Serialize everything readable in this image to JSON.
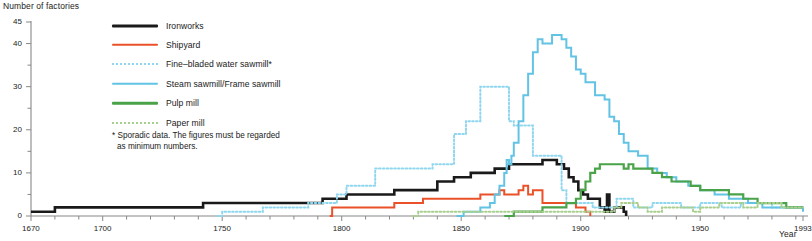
{
  "axes": {
    "y_title": "Number of factories",
    "x_title": "Year",
    "y_tick_labels": [
      "45",
      "40",
      "30",
      "20",
      "10",
      "0"
    ],
    "x_tick_labels": [
      "1670",
      "1700",
      "1750",
      "1800",
      "1850",
      "1900",
      "1950",
      "1993"
    ]
  },
  "legend": {
    "items": [
      {
        "label": "Ironworks",
        "color": "#1a1a1a",
        "style": "thick"
      },
      {
        "label": "Shipyard",
        "color": "#ea5128",
        "style": "solid"
      },
      {
        "label": "Fine–bladed water sawmill*",
        "color": "#8fd6ef",
        "style": "dotted"
      },
      {
        "label": "Steam sawmill/Frame sawmill",
        "color": "#62c3e4",
        "style": "solid"
      },
      {
        "label": "Pulp mill",
        "color": "#4aa348",
        "style": "solid"
      },
      {
        "label": "Paper mill",
        "color": "#a8cf8e",
        "style": "dotted"
      }
    ]
  },
  "footnote": {
    "line1": "* Sporadic data. The figures must be regarded",
    "line2": "as minimum numbers."
  },
  "ghost_title": "",
  "chart_data": {
    "type": "line",
    "title": "",
    "xlabel": "Year",
    "ylabel": "Number of factories",
    "xlim": [
      1670,
      1993
    ],
    "ylim": [
      0,
      45
    ],
    "yticks": [
      0,
      5,
      10,
      15,
      20,
      25,
      30,
      35,
      40,
      45
    ],
    "ylabelled_ticks": [
      0,
      10,
      20,
      30,
      40,
      45
    ],
    "xticks": [
      1670,
      1680,
      1690,
      1700,
      1710,
      1720,
      1730,
      1740,
      1750,
      1760,
      1770,
      1780,
      1790,
      1800,
      1810,
      1820,
      1830,
      1840,
      1850,
      1860,
      1870,
      1880,
      1890,
      1900,
      1910,
      1920,
      1930,
      1940,
      1950,
      1960,
      1970,
      1980,
      1990
    ],
    "xlabelled_ticks": [
      1670,
      1700,
      1750,
      1800,
      1850,
      1900,
      1950,
      1993
    ],
    "grid": false,
    "legend_position": "top-left-inside",
    "step_style": "post",
    "series": [
      {
        "name": "Ironworks",
        "color": "#1a1a1a",
        "style": "solid",
        "width": 2.6,
        "points": [
          [
            1670,
            1
          ],
          [
            1678,
            1
          ],
          [
            1680,
            2
          ],
          [
            1740,
            2
          ],
          [
            1742,
            3
          ],
          [
            1790,
            3
          ],
          [
            1792,
            4
          ],
          [
            1800,
            4
          ],
          [
            1802,
            5
          ],
          [
            1820,
            5
          ],
          [
            1822,
            6
          ],
          [
            1838,
            6
          ],
          [
            1840,
            8
          ],
          [
            1845,
            8
          ],
          [
            1847,
            9
          ],
          [
            1852,
            9
          ],
          [
            1854,
            10
          ],
          [
            1862,
            10
          ],
          [
            1864,
            11
          ],
          [
            1868,
            11
          ],
          [
            1870,
            12
          ],
          [
            1882,
            12
          ],
          [
            1884,
            13
          ],
          [
            1888,
            13
          ],
          [
            1890,
            12
          ],
          [
            1893,
            11
          ],
          [
            1895,
            9
          ],
          [
            1897,
            8
          ],
          [
            1899,
            6
          ],
          [
            1901,
            5
          ],
          [
            1903,
            4
          ],
          [
            1906,
            4
          ],
          [
            1908,
            2
          ],
          [
            1910,
            1
          ],
          [
            1911,
            5
          ],
          [
            1912,
            1
          ],
          [
            1914,
            2
          ],
          [
            1916,
            2
          ],
          [
            1918,
            1
          ],
          [
            1919,
            0
          ]
        ]
      },
      {
        "name": "Shipyard",
        "color": "#ea5128",
        "style": "solid",
        "width": 2.0,
        "points": [
          [
            1795,
            0
          ],
          [
            1796,
            2
          ],
          [
            1820,
            2
          ],
          [
            1822,
            3
          ],
          [
            1832,
            3
          ],
          [
            1834,
            4
          ],
          [
            1856,
            4
          ],
          [
            1858,
            5
          ],
          [
            1864,
            5
          ],
          [
            1866,
            6
          ],
          [
            1868,
            5
          ],
          [
            1872,
            5
          ],
          [
            1874,
            6
          ],
          [
            1876,
            7
          ],
          [
            1878,
            5
          ],
          [
            1880,
            6
          ],
          [
            1882,
            6
          ],
          [
            1884,
            3
          ],
          [
            1896,
            3
          ],
          [
            1898,
            2
          ],
          [
            1900,
            2
          ],
          [
            1902,
            1
          ],
          [
            1904,
            0
          ]
        ]
      },
      {
        "name": "Fine–bladed water sawmill*",
        "color": "#8fd6ef",
        "style": "dotted",
        "width": 2.0,
        "points": [
          [
            1748,
            0
          ],
          [
            1750,
            1
          ],
          [
            1765,
            1
          ],
          [
            1767,
            2
          ],
          [
            1784,
            2
          ],
          [
            1786,
            3
          ],
          [
            1796,
            3
          ],
          [
            1798,
            5
          ],
          [
            1800,
            5
          ],
          [
            1802,
            7
          ],
          [
            1812,
            7
          ],
          [
            1814,
            11
          ],
          [
            1836,
            11
          ],
          [
            1838,
            12
          ],
          [
            1845,
            12
          ],
          [
            1847,
            19
          ],
          [
            1850,
            19
          ],
          [
            1852,
            22
          ],
          [
            1856,
            22
          ],
          [
            1858,
            30
          ],
          [
            1868,
            30
          ],
          [
            1870,
            22
          ],
          [
            1872,
            21
          ],
          [
            1878,
            21
          ],
          [
            1880,
            14
          ],
          [
            1890,
            14
          ],
          [
            1892,
            6
          ],
          [
            1894,
            3
          ],
          [
            1903,
            3
          ],
          [
            1905,
            2
          ],
          [
            1913,
            2
          ],
          [
            1915,
            4
          ],
          [
            1920,
            4
          ],
          [
            1922,
            2
          ],
          [
            1928,
            2
          ],
          [
            1930,
            3
          ],
          [
            1940,
            3
          ],
          [
            1942,
            2
          ],
          [
            1948,
            2
          ],
          [
            1950,
            3
          ],
          [
            1957,
            3
          ],
          [
            1959,
            2
          ],
          [
            1965,
            2
          ],
          [
            1967,
            3
          ],
          [
            1978,
            3
          ],
          [
            1980,
            2
          ],
          [
            1993,
            2
          ]
        ]
      },
      {
        "name": "Steam sawmill/Frame sawmill",
        "color": "#62c3e4",
        "style": "solid",
        "width": 2.0,
        "points": [
          [
            1848,
            0
          ],
          [
            1851,
            1
          ],
          [
            1856,
            1
          ],
          [
            1858,
            2
          ],
          [
            1862,
            3
          ],
          [
            1864,
            5
          ],
          [
            1866,
            7
          ],
          [
            1868,
            10
          ],
          [
            1869,
            13
          ],
          [
            1870,
            12
          ],
          [
            1871,
            14
          ],
          [
            1872,
            17
          ],
          [
            1874,
            22
          ],
          [
            1876,
            28
          ],
          [
            1878,
            33
          ],
          [
            1880,
            38
          ],
          [
            1882,
            41
          ],
          [
            1884,
            40
          ],
          [
            1886,
            40
          ],
          [
            1888,
            42
          ],
          [
            1890,
            42
          ],
          [
            1892,
            41
          ],
          [
            1894,
            39
          ],
          [
            1896,
            37
          ],
          [
            1898,
            34
          ],
          [
            1900,
            33
          ],
          [
            1902,
            31
          ],
          [
            1904,
            31
          ],
          [
            1906,
            28
          ],
          [
            1908,
            28
          ],
          [
            1910,
            27
          ],
          [
            1912,
            23
          ],
          [
            1914,
            22
          ],
          [
            1916,
            19
          ],
          [
            1918,
            17
          ],
          [
            1920,
            15
          ],
          [
            1924,
            14
          ],
          [
            1928,
            11
          ],
          [
            1932,
            10
          ],
          [
            1936,
            9
          ],
          [
            1940,
            8
          ],
          [
            1945,
            7
          ],
          [
            1950,
            6
          ],
          [
            1956,
            5
          ],
          [
            1962,
            4
          ],
          [
            1970,
            3
          ],
          [
            1976,
            2
          ],
          [
            1984,
            2
          ],
          [
            1993,
            1
          ]
        ]
      },
      {
        "name": "Pulp mill",
        "color": "#4aa348",
        "style": "solid",
        "width": 2.2,
        "points": [
          [
            1868,
            0
          ],
          [
            1872,
            1
          ],
          [
            1880,
            1
          ],
          [
            1884,
            2
          ],
          [
            1890,
            2
          ],
          [
            1894,
            3
          ],
          [
            1898,
            4
          ],
          [
            1900,
            6
          ],
          [
            1902,
            8
          ],
          [
            1904,
            10
          ],
          [
            1906,
            11
          ],
          [
            1908,
            12
          ],
          [
            1912,
            12
          ],
          [
            1916,
            12
          ],
          [
            1918,
            11
          ],
          [
            1920,
            12
          ],
          [
            1922,
            11
          ],
          [
            1926,
            11
          ],
          [
            1930,
            10
          ],
          [
            1934,
            9
          ],
          [
            1938,
            8
          ],
          [
            1942,
            8
          ],
          [
            1946,
            7
          ],
          [
            1950,
            6
          ],
          [
            1956,
            6
          ],
          [
            1962,
            5
          ],
          [
            1968,
            4
          ],
          [
            1974,
            3
          ],
          [
            1980,
            3
          ],
          [
            1986,
            2
          ],
          [
            1993,
            2
          ]
        ]
      },
      {
        "name": "Paper mill",
        "color": "#a8cf8e",
        "style": "dotted",
        "width": 2.0,
        "points": [
          [
            1830,
            0
          ],
          [
            1832,
            1
          ],
          [
            1880,
            1
          ],
          [
            1895,
            1
          ],
          [
            1900,
            1
          ],
          [
            1910,
            1
          ],
          [
            1914,
            2
          ],
          [
            1917,
            3
          ],
          [
            1920,
            3
          ],
          [
            1924,
            2
          ],
          [
            1928,
            1
          ],
          [
            1934,
            2
          ],
          [
            1944,
            2
          ],
          [
            1947,
            1
          ],
          [
            1950,
            2
          ],
          [
            1954,
            2
          ],
          [
            1958,
            3
          ],
          [
            1965,
            3
          ],
          [
            1968,
            2
          ],
          [
            1972,
            2
          ],
          [
            1974,
            3
          ],
          [
            1982,
            3
          ],
          [
            1984,
            2
          ],
          [
            1993,
            2
          ]
        ]
      }
    ]
  }
}
